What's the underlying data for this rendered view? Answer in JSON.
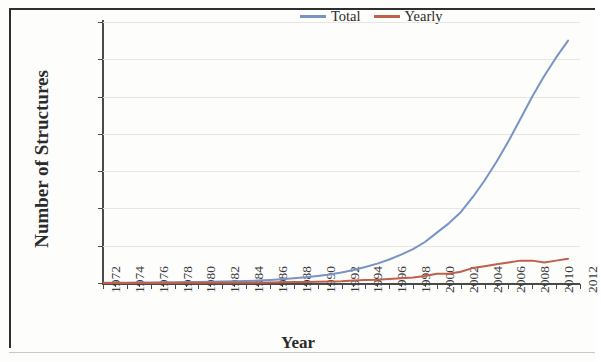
{
  "figure": {
    "ylabel": "Number of Structures",
    "xlabel": "Year"
  },
  "legend": {
    "position": "top-right",
    "entries": [
      {
        "label": "Total",
        "color": "#7794c4"
      },
      {
        "label": "Yearly",
        "color": "#c0604a"
      }
    ]
  },
  "axes": {
    "y_ticks": [
      "0",
      "10000",
      "20000",
      "30000",
      "40000",
      "50000",
      "60000",
      "70000"
    ],
    "x_ticks": [
      "1972",
      "1974",
      "1976",
      "1978",
      "1980",
      "1982",
      "1984",
      "1986",
      "1988",
      "1990",
      "1992",
      "1994",
      "1996",
      "1998",
      "2000",
      "2002",
      "2004",
      "2006",
      "2008",
      "2010",
      "2012"
    ]
  },
  "chart_data": {
    "type": "line",
    "title": "",
    "xlabel": "Year",
    "ylabel": "Number of Structures",
    "xlim": [
      1972,
      2012
    ],
    "ylim": [
      0,
      70000
    ],
    "grid": true,
    "legend_position": "top-right",
    "x": [
      1972,
      1973,
      1974,
      1975,
      1976,
      1977,
      1978,
      1979,
      1980,
      1981,
      1982,
      1983,
      1984,
      1985,
      1986,
      1987,
      1988,
      1989,
      1990,
      1991,
      1992,
      1993,
      1994,
      1995,
      1996,
      1997,
      1998,
      1999,
      2000,
      2001,
      2002,
      2003,
      2004,
      2005,
      2006,
      2007,
      2008,
      2009,
      2010,
      2011
    ],
    "series": [
      {
        "name": "Total",
        "color": "#7794c4",
        "values": [
          50,
          70,
          100,
          130,
          160,
          190,
          220,
          260,
          300,
          350,
          400,
          470,
          550,
          650,
          800,
          1000,
          1250,
          1550,
          1900,
          2300,
          2800,
          3500,
          4300,
          5200,
          6300,
          7600,
          9100,
          11000,
          13500,
          16000,
          19000,
          23000,
          27500,
          32500,
          38000,
          44000,
          50000,
          55500,
          60500,
          65000
        ]
      },
      {
        "name": "Yearly",
        "color": "#c0604a",
        "values": [
          10,
          20,
          30,
          30,
          30,
          30,
          30,
          40,
          40,
          50,
          50,
          70,
          80,
          100,
          150,
          200,
          250,
          300,
          350,
          400,
          500,
          700,
          800,
          900,
          1100,
          1300,
          1500,
          1900,
          2500,
          2500,
          3000,
          4000,
          4500,
          5000,
          5500,
          6000,
          6000,
          5500,
          6000,
          6500
        ]
      }
    ]
  }
}
